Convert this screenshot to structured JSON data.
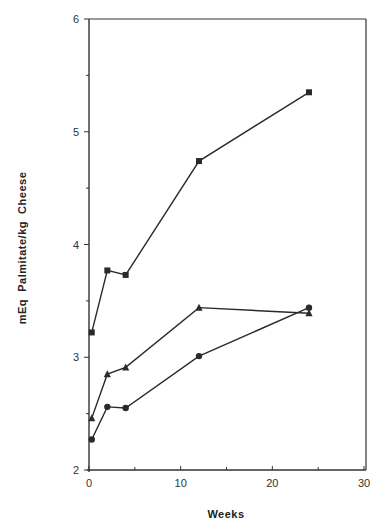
{
  "chart_data": {
    "type": "line",
    "title": "",
    "xlabel": "Weeks",
    "ylabel": "mEq  Palmitate/kg  Cheese",
    "xlim": [
      0,
      30
    ],
    "ylim": [
      2,
      6
    ],
    "x_ticks": [
      0,
      10,
      20,
      30
    ],
    "y_ticks": [
      2,
      3,
      4,
      5,
      6
    ],
    "x_minor_step": 5,
    "y_minor_step": 0.5,
    "grid": false,
    "legend": null,
    "series": [
      {
        "name": "square",
        "marker": "square",
        "x": [
          0.3,
          2,
          4,
          12,
          24
        ],
        "y": [
          3.22,
          3.77,
          3.73,
          4.74,
          5.35
        ]
      },
      {
        "name": "triangle",
        "marker": "triangle",
        "x": [
          0.3,
          2,
          4,
          12,
          24
        ],
        "y": [
          2.46,
          2.85,
          2.91,
          3.44,
          3.39
        ]
      },
      {
        "name": "circle",
        "marker": "circle",
        "x": [
          0.3,
          2,
          4,
          12,
          24
        ],
        "y": [
          2.27,
          2.56,
          2.55,
          3.01,
          3.44
        ]
      }
    ]
  },
  "colors": {
    "line": "#2a2a2a",
    "axis": "#333333"
  }
}
